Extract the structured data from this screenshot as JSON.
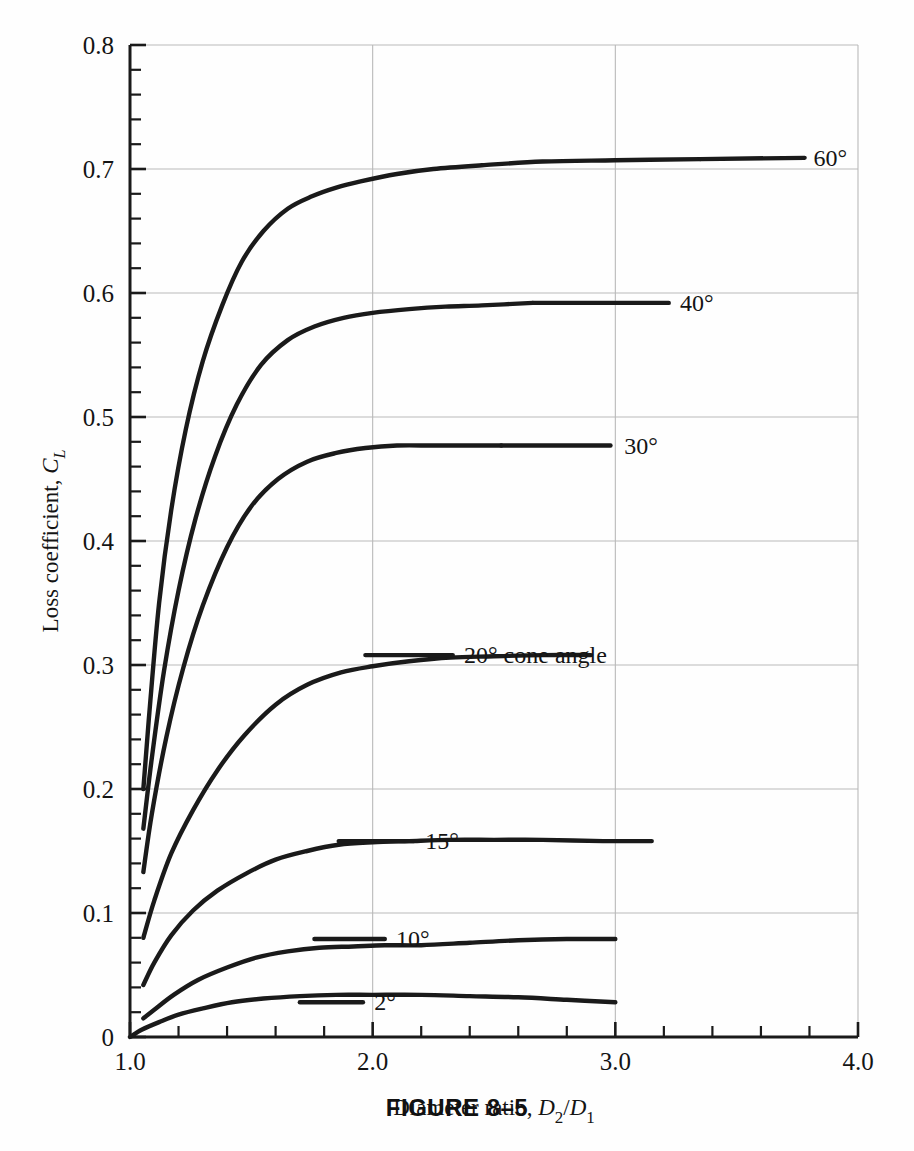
{
  "figure": {
    "caption": "FIGURE 8–5",
    "number": "8–5"
  },
  "chart_data": {
    "type": "line",
    "title": "",
    "xlabel": "Diameter ratio, D2/D1",
    "ylabel": "Loss coefficient, CL",
    "xlim": [
      1.0,
      4.0
    ],
    "ylim": [
      0.0,
      0.8
    ],
    "grid": true,
    "legend_position": "right-inline-labels",
    "xticks": [
      1.0,
      2.0,
      3.0,
      4.0
    ],
    "xticklabels": [
      "1.0",
      "2.0",
      "3.0",
      "4.0"
    ],
    "x_minor_tick_step": 0.2,
    "yticks": [
      0,
      0.1,
      0.2,
      0.3,
      0.4,
      0.5,
      0.6,
      0.7,
      0.8
    ],
    "yticklabels": [
      "0",
      "0.1",
      "0.2",
      "0.3",
      "0.4",
      "0.5",
      "0.6",
      "0.7",
      "0.8"
    ],
    "y_minor_tick_step": 0.02,
    "x_gridlines": [
      2.0,
      3.0
    ],
    "y_gridlines": [
      0.1,
      0.2,
      0.3,
      0.4,
      0.5,
      0.6,
      0.7,
      0.8
    ],
    "series": [
      {
        "name": "60°",
        "label": "60°",
        "label_x": 3.8,
        "label_y": 0.709,
        "leader_from_x": 3.35,
        "leader_to_x": 3.78,
        "x": [
          1.055,
          1.08,
          1.12,
          1.17,
          1.23,
          1.3,
          1.38,
          1.46,
          1.55,
          1.65,
          1.75,
          1.85,
          1.95,
          2.1,
          2.25,
          2.45,
          2.7,
          3.0,
          3.35
        ],
        "y": [
          0.2,
          0.262,
          0.35,
          0.425,
          0.49,
          0.545,
          0.59,
          0.625,
          0.65,
          0.668,
          0.678,
          0.685,
          0.69,
          0.696,
          0.7,
          0.703,
          0.706,
          0.707,
          0.708
        ]
      },
      {
        "name": "40°",
        "label": "40°",
        "label_x": 3.25,
        "label_y": 0.592,
        "leader_from_x": 2.66,
        "leader_to_x": 3.22,
        "x": [
          1.055,
          1.09,
          1.14,
          1.2,
          1.27,
          1.35,
          1.44,
          1.54,
          1.65,
          1.76,
          1.88,
          2.0,
          2.15,
          2.3,
          2.45,
          2.66
        ],
        "y": [
          0.168,
          0.225,
          0.295,
          0.36,
          0.418,
          0.468,
          0.51,
          0.542,
          0.562,
          0.573,
          0.58,
          0.584,
          0.587,
          0.589,
          0.59,
          0.592
        ]
      },
      {
        "name": "30°",
        "label": "30°",
        "label_x": 3.02,
        "label_y": 0.477,
        "leader_from_x": 2.53,
        "leader_to_x": 2.98,
        "x": [
          1.055,
          1.09,
          1.15,
          1.22,
          1.3,
          1.4,
          1.5,
          1.61,
          1.73,
          1.85,
          1.97,
          2.1,
          2.25,
          2.4,
          2.53
        ],
        "y": [
          0.133,
          0.18,
          0.242,
          0.298,
          0.348,
          0.395,
          0.428,
          0.45,
          0.464,
          0.471,
          0.475,
          0.477,
          0.477,
          0.477,
          0.477
        ]
      },
      {
        "name": "20° cone angle",
        "label": "20° cone angle",
        "label_x": 2.36,
        "label_y": 0.308,
        "leader_from_x": 1.97,
        "leader_to_x": 2.33,
        "x": [
          1.055,
          1.1,
          1.17,
          1.26,
          1.36,
          1.47,
          1.6,
          1.73,
          1.87,
          2.0,
          2.15,
          2.32,
          2.5,
          2.7,
          2.9
        ],
        "y": [
          0.08,
          0.11,
          0.148,
          0.183,
          0.215,
          0.243,
          0.268,
          0.284,
          0.294,
          0.299,
          0.303,
          0.306,
          0.307,
          0.308,
          0.308
        ]
      },
      {
        "name": "15°",
        "label": "15°",
        "label_x": 2.2,
        "label_y": 0.158,
        "leader_from_x": 1.86,
        "leader_to_x": 2.17,
        "x": [
          1.055,
          1.1,
          1.17,
          1.26,
          1.36,
          1.48,
          1.6,
          1.73,
          1.86,
          2.0,
          2.15,
          2.32,
          2.5,
          2.7,
          2.95,
          3.15
        ],
        "y": [
          0.042,
          0.06,
          0.082,
          0.102,
          0.118,
          0.132,
          0.143,
          0.15,
          0.155,
          0.157,
          0.158,
          0.159,
          0.159,
          0.159,
          0.158,
          0.158
        ]
      },
      {
        "name": "10°",
        "label": "10°",
        "label_x": 2.08,
        "label_y": 0.079,
        "leader_from_x": 1.76,
        "leader_to_x": 2.05,
        "x": [
          1.055,
          1.1,
          1.18,
          1.28,
          1.4,
          1.52,
          1.65,
          1.78,
          1.92,
          2.05,
          2.2,
          2.4,
          2.6,
          2.8,
          3.0
        ],
        "y": [
          0.015,
          0.022,
          0.034,
          0.046,
          0.056,
          0.064,
          0.069,
          0.072,
          0.073,
          0.074,
          0.074,
          0.076,
          0.078,
          0.079,
          0.079
        ]
      },
      {
        "name": "2°",
        "label": "2°",
        "label_x": 1.99,
        "label_y": 0.028,
        "leader_from_x": 1.7,
        "leader_to_x": 1.96,
        "x": [
          1.0,
          1.05,
          1.12,
          1.2,
          1.3,
          1.42,
          1.55,
          1.7,
          1.85,
          2.0,
          2.2,
          2.4,
          2.6,
          2.8,
          3.0
        ],
        "y": [
          0.0,
          0.006,
          0.012,
          0.018,
          0.023,
          0.028,
          0.031,
          0.033,
          0.034,
          0.034,
          0.034,
          0.033,
          0.032,
          0.03,
          0.028
        ]
      }
    ]
  }
}
